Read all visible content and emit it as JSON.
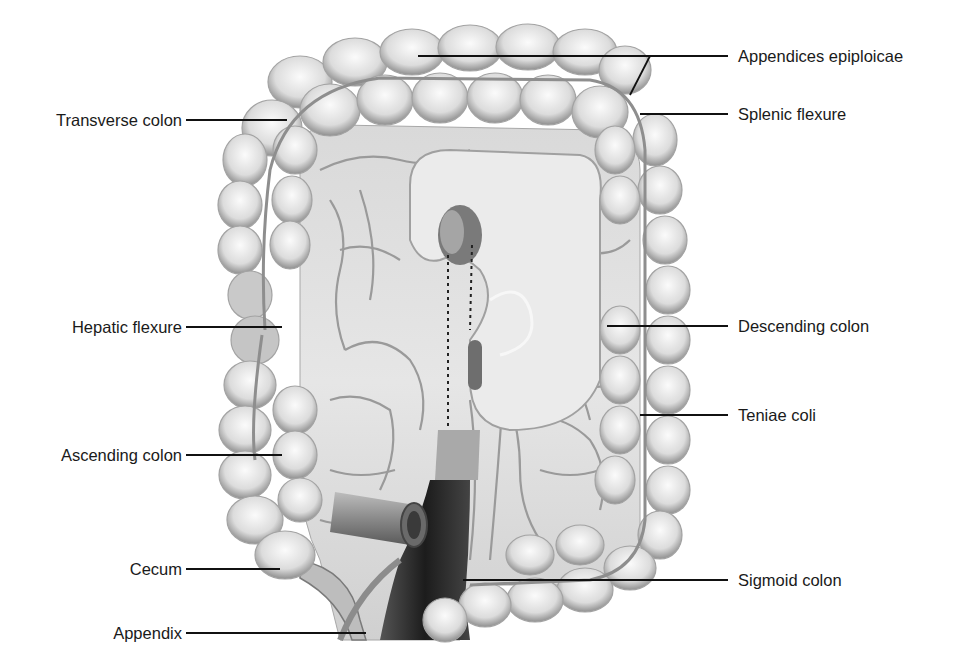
{
  "figure": {
    "colors": {
      "background": "#ffffff",
      "colon_fill": "#e8e8e8",
      "colon_shadow": "#9a9a9a",
      "mesentery": "#d8d8d8",
      "vessel": "#8c8c8c",
      "rectum_dark": "#2a2a2a",
      "leader_line": "#111111",
      "label_text": "#1a1a1a"
    }
  },
  "labels": {
    "left": [
      {
        "id": "transverse_colon",
        "text": "Transverse colon",
        "text_right_x": 182,
        "y": 120,
        "line_to": [
          287,
          120
        ]
      },
      {
        "id": "hepatic_flexure",
        "text": "Hepatic flexure",
        "text_right_x": 182,
        "y": 327,
        "line_to": [
          282,
          327
        ]
      },
      {
        "id": "ascending_colon",
        "text": "Ascending colon",
        "text_right_x": 182,
        "y": 455,
        "line_to": [
          282,
          455
        ]
      },
      {
        "id": "cecum",
        "text": "Cecum",
        "text_right_x": 182,
        "y": 569,
        "line_to": [
          280,
          569
        ]
      },
      {
        "id": "appendix",
        "text": "Appendix",
        "text_right_x": 182,
        "y": 633,
        "line_to": [
          366,
          633
        ]
      }
    ],
    "right": [
      {
        "id": "appendices_epiploicae",
        "text": "Appendices epiploicae",
        "text_left_x": 738,
        "y": 56,
        "line_from": [
          418,
          56
        ],
        "branch_to": [
          630,
          95
        ]
      },
      {
        "id": "splenic_flexure",
        "text": "Splenic flexure",
        "text_left_x": 738,
        "y": 114,
        "line_from": [
          640,
          114
        ]
      },
      {
        "id": "descending_colon",
        "text": "Descending colon",
        "text_left_x": 738,
        "y": 326,
        "line_from": [
          607,
          326
        ]
      },
      {
        "id": "teniae_coli",
        "text": "Teniae coli",
        "text_left_x": 738,
        "y": 415,
        "line_from": [
          640,
          415
        ]
      },
      {
        "id": "sigmoid_colon",
        "text": "Sigmoid colon",
        "text_left_x": 738,
        "y": 580,
        "line_from": [
          463,
          580
        ]
      }
    ]
  }
}
